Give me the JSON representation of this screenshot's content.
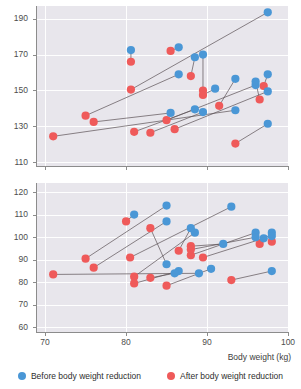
{
  "chart_data": {
    "type": "scatter",
    "title": "",
    "xlabel": "Body weight (kg)",
    "legend_position": "bottom",
    "grid": true,
    "series": [
      {
        "name": "Before body weight reduction",
        "color": "#4a97d6"
      },
      {
        "name": "After body weight reduction",
        "color": "#ef5a5a"
      }
    ],
    "panels": [
      {
        "id": "top-panel",
        "ylabel": "",
        "ylim": [
          108,
          197
        ],
        "yticks": [
          110,
          130,
          150,
          170,
          190
        ],
        "xlim": [
          69,
          100
        ],
        "xticks": [
          70,
          80,
          90,
          100
        ],
        "pairs": [
          {
            "after_x": 71.0,
            "after_y": 124.5,
            "before_x": 93.5,
            "before_y": 139.0
          },
          {
            "after_x": 75.0,
            "after_y": 136.0,
            "before_x": 86.5,
            "before_y": 159.0
          },
          {
            "after_x": 76.0,
            "after_y": 132.5,
            "before_x": 85.5,
            "before_y": 137.5
          },
          {
            "after_x": 80.6,
            "after_y": 166.0,
            "before_x": 80.6,
            "before_y": 172.5
          },
          {
            "after_x": 80.6,
            "after_y": 150.5,
            "before_x": 97.5,
            "before_y": 193.5
          },
          {
            "after_x": 81.0,
            "after_y": 127.0,
            "before_x": 88.5,
            "before_y": 139.5
          },
          {
            "after_x": 83.0,
            "after_y": 126.5,
            "before_x": 89.5,
            "before_y": 138.0
          },
          {
            "after_x": 85.0,
            "after_y": 133.5,
            "before_x": 96.0,
            "before_y": 153.0
          },
          {
            "after_x": 85.5,
            "after_y": 172.0,
            "before_x": 86.5,
            "before_y": 174.0
          },
          {
            "after_x": 86.0,
            "after_y": 128.5,
            "before_x": 97.5,
            "before_y": 149.5
          },
          {
            "after_x": 88.0,
            "after_y": 158.0,
            "before_x": 88.5,
            "before_y": 168.5
          },
          {
            "after_x": 89.5,
            "after_y": 150.0,
            "before_x": 89.5,
            "before_y": 170.0
          },
          {
            "after_x": 89.5,
            "after_y": 147.5,
            "before_x": 91.0,
            "before_y": 151.0
          },
          {
            "after_x": 91.5,
            "after_y": 141.5,
            "before_x": 93.5,
            "before_y": 156.5
          },
          {
            "after_x": 93.5,
            "after_y": 120.5,
            "before_x": 97.5,
            "before_y": 131.5
          },
          {
            "after_x": 96.5,
            "after_y": 145.0,
            "before_x": 96.0,
            "before_y": 155.0
          },
          {
            "after_x": 97.0,
            "after_y": 152.5,
            "before_x": 97.5,
            "before_y": 159.0
          }
        ]
      },
      {
        "id": "bottom-panel",
        "ylabel": "",
        "ylim": [
          58,
          124
        ],
        "yticks": [
          60,
          70,
          80,
          90,
          100,
          110,
          120
        ],
        "xlim": [
          69,
          100
        ],
        "xticks": [
          70,
          80,
          90,
          100
        ],
        "pairs": [
          {
            "after_x": 71.0,
            "after_y": 83.5,
            "before_x": 89.0,
            "before_y": 84.0
          },
          {
            "after_x": 75.0,
            "after_y": 90.5,
            "before_x": 85.0,
            "before_y": 114.0
          },
          {
            "after_x": 76.0,
            "after_y": 86.5,
            "before_x": 85.0,
            "before_y": 107.0
          },
          {
            "after_x": 80.0,
            "after_y": 107.0,
            "before_x": 81.0,
            "before_y": 110.0
          },
          {
            "after_x": 80.5,
            "after_y": 91.0,
            "before_x": 93.0,
            "before_y": 113.5
          },
          {
            "after_x": 81.0,
            "after_y": 82.5,
            "before_x": 88.5,
            "before_y": 102.0
          },
          {
            "after_x": 81.0,
            "after_y": 79.5,
            "before_x": 86.5,
            "before_y": 85.0
          },
          {
            "after_x": 83.0,
            "after_y": 104.0,
            "before_x": 85.0,
            "before_y": 88.0
          },
          {
            "after_x": 83.0,
            "after_y": 82.0,
            "before_x": 86.0,
            "before_y": 84.0
          },
          {
            "after_x": 85.0,
            "after_y": 78.5,
            "before_x": 90.5,
            "before_y": 86.0
          },
          {
            "after_x": 86.5,
            "after_y": 94.0,
            "before_x": 88.0,
            "before_y": 104.0
          },
          {
            "after_x": 88.0,
            "after_y": 96.0,
            "before_x": 92.0,
            "before_y": 97.0
          },
          {
            "after_x": 88.0,
            "after_y": 92.0,
            "before_x": 96.0,
            "before_y": 102.0
          },
          {
            "after_x": 88.0,
            "after_y": 94.5,
            "before_x": 96.0,
            "before_y": 100.0
          },
          {
            "after_x": 89.5,
            "after_y": 91.0,
            "before_x": 97.0,
            "before_y": 99.5
          },
          {
            "after_x": 93.0,
            "after_y": 81.0,
            "before_x": 98.0,
            "before_y": 85.0
          },
          {
            "after_x": 96.5,
            "after_y": 97.0,
            "before_x": 98.0,
            "before_y": 102.0
          },
          {
            "after_x": 98.0,
            "after_y": 98.0,
            "before_x": 98.0,
            "before_y": 100.5
          }
        ]
      }
    ]
  },
  "legend": {
    "items": [
      {
        "label": "Before body weight reduction",
        "color": "#4a97d6"
      },
      {
        "label": "After body weight reduction",
        "color": "#ef5a5a"
      }
    ]
  },
  "axis": {
    "x_title": "Body weight (kg)"
  }
}
